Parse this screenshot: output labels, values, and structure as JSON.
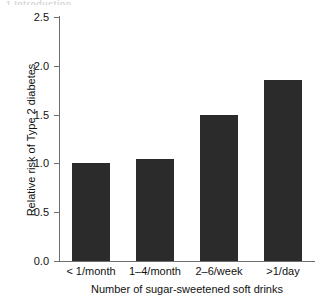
{
  "figure": {
    "clipped_header_text": "1 Introduction",
    "background_color": "#ffffff"
  },
  "chart_data": {
    "type": "bar",
    "title": "",
    "subtitle": "",
    "categories": [
      "< 1/month",
      "1–4/month",
      "2–6/week",
      ">1/day"
    ],
    "values": [
      1.0,
      1.05,
      1.5,
      1.85
    ],
    "series": [
      {
        "name": "Relative risk of Type 2 diabetes",
        "values": [
          1.0,
          1.05,
          1.5,
          1.85
        ]
      }
    ],
    "xlabel": "Number of sugar-sweetened soft drinks",
    "ylabel": "Relative risk of Type 2 diabetes",
    "ylim": [
      0.0,
      2.5
    ],
    "ytick_labels": [
      "0.0",
      "0.5",
      "1.0",
      "1.5",
      "2.0",
      "2.5"
    ],
    "ytick_values": [
      0.0,
      0.5,
      1.0,
      1.5,
      2.0,
      2.5
    ],
    "grid": false,
    "legend": false,
    "legend_position": "none",
    "bar_color": "#2b2b2b",
    "axis_color": "#6e6e6e",
    "annotations": []
  }
}
